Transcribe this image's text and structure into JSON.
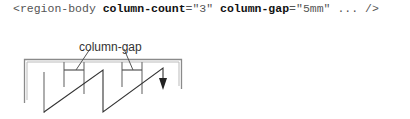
{
  "code": {
    "open": "<region-body ",
    "attr1_name": "column-count",
    "attr1_eq": "=\"3\" ",
    "attr2_name": "column-gap",
    "attr2_eq": "=\"5mm\" ... />"
  },
  "diagram": {
    "label": "column-gap",
    "column_count": 3,
    "column_gap": "5mm",
    "line_color": "#555555",
    "frame_color": "#777777",
    "arrow": "down-arrow"
  }
}
